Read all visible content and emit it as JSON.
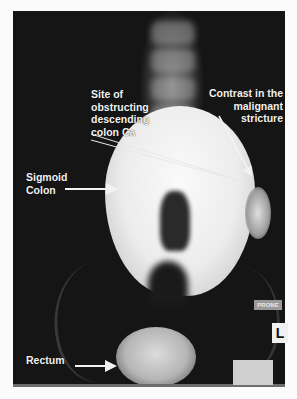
{
  "figure": {
    "type": "radiograph"
  },
  "annotations": {
    "obstruction_site": "Site of obstructing descending colon Ca",
    "obstruction_lines": [
      "Site of",
      "obstructing",
      "descending",
      "colon Ca"
    ],
    "contrast_stricture_lines": [
      "Contrast in the",
      "malignant stricture"
    ],
    "sigmoid_lines": [
      "Sigmoid",
      "Colon"
    ],
    "rectum": "Rectum"
  },
  "markers": {
    "position": "PRONE",
    "side": "L"
  },
  "colors": {
    "background": "#151515",
    "page": "#fbfbfb",
    "label": "#f2f2f2"
  }
}
